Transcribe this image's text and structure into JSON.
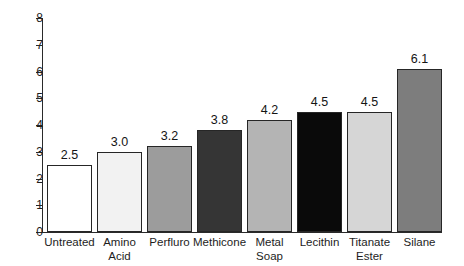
{
  "chart_data": {
    "type": "bar",
    "title": "",
    "subtitle": "",
    "xlabel": "",
    "ylabel": "",
    "ylim": [
      0,
      8
    ],
    "xlim_note": "categorical",
    "grid": false,
    "legend": "none",
    "y_ticks": [
      "0",
      "1",
      "2",
      "3",
      "4",
      "5",
      "6",
      "7",
      "8"
    ],
    "value_label_format": "one decimal, above bar",
    "categories": [
      "Untreated",
      "Amino Acid",
      "Perfluro",
      "Methicone",
      "Metal Soap",
      "Lecithin",
      "Titanate Ester",
      "Silane"
    ],
    "category_lines": [
      [
        "Untreated"
      ],
      [
        "Amino",
        "Acid"
      ],
      [
        "Perfluro"
      ],
      [
        "Methicone"
      ],
      [
        "Metal",
        "Soap"
      ],
      [
        "Lecithin"
      ],
      [
        "Titanate",
        "Ester"
      ],
      [
        "Silane"
      ]
    ],
    "values": [
      2.5,
      3.0,
      3.2,
      3.8,
      4.2,
      4.5,
      4.5,
      6.1
    ],
    "value_labels": [
      "2.5",
      "3.0",
      "3.2",
      "3.8",
      "4.2",
      "4.5",
      "4.5",
      "6.1"
    ],
    "bar_colors": [
      "#ffffff",
      "#f2f2f2",
      "#9c9c9c",
      "#353535",
      "#b4b4b4",
      "#0a0a0a",
      "#d6d6d6",
      "#7d7d7d"
    ],
    "bar_edge_color": "#262626",
    "axis_color": "#2a2a2a",
    "background_color": "#ffffff",
    "text_color": "#1d1d1d"
  }
}
